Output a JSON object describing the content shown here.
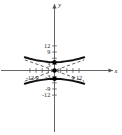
{
  "chart_data": {
    "type": "line",
    "title": "",
    "xlabel": "x",
    "ylabel": "y",
    "xlim": [
      -14.5,
      14.5
    ],
    "ylim": [
      -13.5,
      14.0
    ],
    "grid": false,
    "legend": null,
    "x_ticks_labeled": [
      -12,
      -9,
      9,
      12
    ],
    "y_ticks_labeled": [
      12,
      9,
      3,
      -3,
      -9,
      -12
    ],
    "x_tick_label_texts": [
      "-12",
      "-9",
      "9",
      "12"
    ],
    "y_tick_label_texts": [
      "12",
      "9",
      "3",
      "-3",
      "-9",
      "-12"
    ],
    "x_tick_step": 3,
    "y_tick_step": 3,
    "center": [
      0,
      0
    ],
    "vertices": [
      [
        0,
        4
      ],
      [
        0,
        -4
      ]
    ],
    "asymptote_slopes": [
      0.36,
      -0.36
    ],
    "series": [
      {
        "name": "upper-branch",
        "style": "solid",
        "x": [
          -14.5,
          -12,
          -9,
          -6,
          -3,
          0,
          3,
          6,
          9,
          12,
          14.5
        ],
        "y": [
          6.45,
          5.77,
          5.05,
          4.57,
          4.15,
          4.0,
          4.15,
          4.57,
          5.05,
          5.77,
          6.45
        ]
      },
      {
        "name": "lower-branch",
        "style": "solid",
        "x": [
          -14.5,
          -12,
          -9,
          -6,
          -3,
          0,
          3,
          6,
          9,
          12,
          14.5
        ],
        "y": [
          -6.45,
          -5.77,
          -5.05,
          -4.57,
          -4.15,
          -4.0,
          -4.15,
          -4.57,
          -5.05,
          -5.77,
          -6.45
        ]
      },
      {
        "name": "asymptote-positive",
        "style": "dashed",
        "x": [
          -14.5,
          14.5
        ],
        "y": [
          -5.2,
          5.2
        ]
      },
      {
        "name": "asymptote-negative",
        "style": "dashed",
        "x": [
          -14.5,
          14.5
        ],
        "y": [
          5.2,
          -5.2
        ]
      }
    ],
    "marked_points": [
      {
        "name": "center-point",
        "x": 0,
        "y": 0
      },
      {
        "name": "vertex-upper",
        "x": 0,
        "y": 4
      },
      {
        "name": "vertex-lower",
        "x": 0,
        "y": -4
      }
    ],
    "colors": {
      "curve": "#111111",
      "asymptote": "#4d4d4d",
      "axis": "#555555",
      "point": "#000000",
      "background": "#ffffff"
    }
  }
}
